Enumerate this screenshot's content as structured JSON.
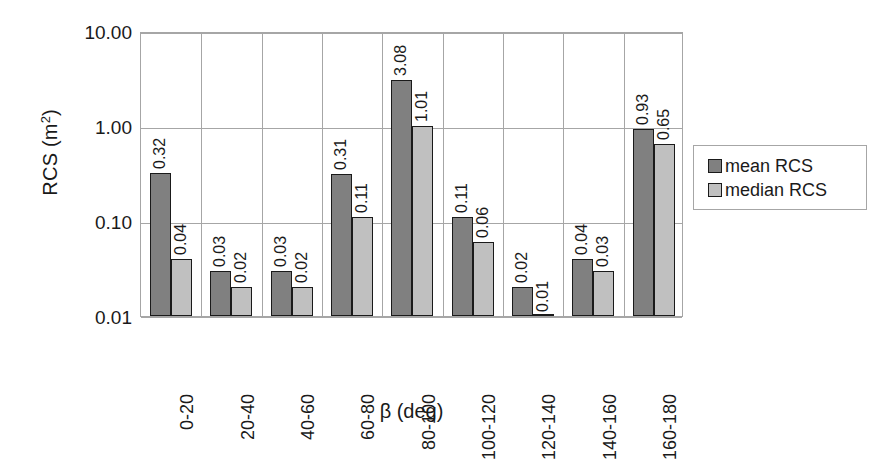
{
  "chart_data": {
    "type": "bar",
    "title": "",
    "xlabel": "β (deg)",
    "ylabel": "RCS (m²)",
    "ylabel_base": "RCS (m",
    "ylabel_sup": "2",
    "ylabel_close": ")",
    "yscale": "log",
    "ylim": [
      0.01,
      10.0
    ],
    "ytick_labels": [
      "10.00",
      "1.00",
      "0.10",
      "0.01"
    ],
    "ytick_values": [
      10.0,
      1.0,
      0.1,
      0.01
    ],
    "grid": true,
    "legend_position": "right",
    "categories": [
      "0-20",
      "20-40",
      "40-60",
      "60-80",
      "80-100",
      "100-120",
      "120-140",
      "140-160",
      "160-180"
    ],
    "series": [
      {
        "name": "mean RCS",
        "color": "#808080",
        "values": [
          0.32,
          0.03,
          0.03,
          0.31,
          3.08,
          0.11,
          0.02,
          0.04,
          0.93
        ],
        "labels": [
          "0.32",
          "0.03",
          "0.03",
          "0.31",
          "3.08",
          "0.11",
          "0.02",
          "0.04",
          "0.93"
        ]
      },
      {
        "name": "median RCS",
        "color": "#c0c0c0",
        "values": [
          0.04,
          0.02,
          0.02,
          0.11,
          1.01,
          0.06,
          0.01,
          0.03,
          0.65
        ],
        "labels": [
          "0.04",
          "0.02",
          "0.02",
          "0.11",
          "1.01",
          "0.06",
          "0.01",
          "0.03",
          "0.65"
        ]
      }
    ]
  },
  "legend": {
    "entries": [
      {
        "label": "mean RCS",
        "color": "#808080"
      },
      {
        "label": "median RCS",
        "color": "#c0c0c0"
      }
    ]
  },
  "colors": {
    "mean": "#808080",
    "median": "#c0c0c0",
    "grid": "#a6a6a6",
    "text": "#1a1a1a",
    "background": "#ffffff"
  }
}
